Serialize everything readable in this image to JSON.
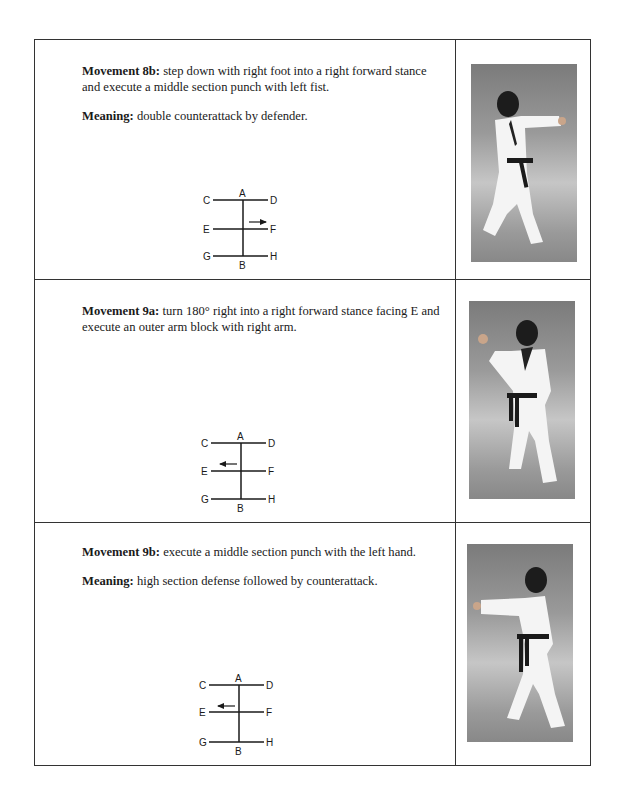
{
  "rows": [
    {
      "movement_label": "Movement 8b:",
      "movement_text": " step down with right foot into a right forward stance and execute a middle section punch with left fist.",
      "meaning_label": "Meaning:",
      "meaning_text": " double counterattack by defender.",
      "diagram": {
        "labels": {
          "A": "A",
          "B": "B",
          "C": "C",
          "D": "D",
          "E": "E",
          "F": "F",
          "G": "G",
          "H": "H"
        },
        "arrow_direction": "right"
      },
      "photo": "martial artist in forward stance, left fist punch"
    },
    {
      "movement_label": "Movement 9a:",
      "movement_text": " turn 180° right into a right forward stance facing E and execute an outer arm block with right arm.",
      "meaning_label": "",
      "meaning_text": "",
      "diagram": {
        "labels": {
          "A": "A",
          "B": "B",
          "C": "C",
          "D": "D",
          "E": "E",
          "F": "F",
          "G": "G",
          "H": "H"
        },
        "arrow_direction": "left"
      },
      "photo": "martial artist in forward stance, outer arm block"
    },
    {
      "movement_label": "Movement 9b:",
      "movement_text": " execute a middle section punch with the left hand.",
      "meaning_label": "Meaning:",
      "meaning_text": " high section defense followed by counterattack.",
      "diagram": {
        "labels": {
          "A": "A",
          "B": "B",
          "C": "C",
          "D": "D",
          "E": "E",
          "F": "F",
          "G": "G",
          "H": "H"
        },
        "arrow_direction": "left"
      },
      "photo": "martial artist in forward stance, middle section punch"
    }
  ]
}
